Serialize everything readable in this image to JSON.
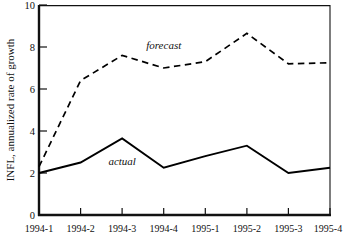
{
  "chart_data": {
    "type": "line",
    "title": "",
    "xlabel": "",
    "ylabel": "INFL, annualized rate of growth",
    "categories": [
      "1994-1",
      "1994-2",
      "1994-3",
      "1994-4",
      "1995-1",
      "1995-2",
      "1995-3",
      "1995-4"
    ],
    "ylim": [
      0,
      10
    ],
    "yticks": [
      0,
      2,
      4,
      6,
      8,
      10
    ],
    "ytick_labels": [
      "0",
      "2",
      "4",
      "6",
      "8",
      "10"
    ],
    "grid": false,
    "legend_position": "inline-annotations",
    "series": [
      {
        "name": "actual",
        "style": "solid",
        "color": "#000000",
        "values": [
          2.0,
          2.5,
          3.65,
          2.25,
          2.8,
          3.3,
          2.0,
          2.25
        ]
      },
      {
        "name": "forecast",
        "style": "dashed",
        "color": "#000000",
        "values": [
          2.3,
          6.4,
          7.6,
          7.0,
          7.3,
          8.65,
          7.2,
          7.25
        ]
      }
    ],
    "annotations": [
      {
        "text": "forecast",
        "x_category": "1994-4",
        "value": 8.1
      },
      {
        "text": "actual",
        "x_category": "1994-3",
        "value": 2.55
      }
    ]
  }
}
